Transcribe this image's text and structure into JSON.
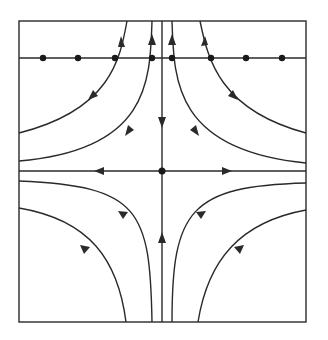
{
  "diagram": {
    "title": "",
    "type": "phase-portrait-saddle",
    "colors": {
      "stroke": "#2a2a2a",
      "background": "#ffffff"
    },
    "frame": {
      "x": 19,
      "y": 21,
      "width": 287,
      "height": 301
    },
    "top_line": {
      "y": 58,
      "dots_x": [
        43,
        78,
        115,
        152,
        172,
        211,
        246,
        282
      ]
    },
    "center": {
      "x": 162,
      "y": 171
    },
    "axes": {
      "horizontal": {
        "y": 171,
        "arrows": [
          "left",
          "right"
        ],
        "direction": "outward"
      },
      "vertical": {
        "x": 162,
        "arrows": [
          "down-from-top",
          "up-from-bottom"
        ],
        "direction": "inward"
      }
    },
    "trajectories": [
      {
        "name": "upper-left-outer",
        "arrows": [
          "up",
          "down-left"
        ]
      },
      {
        "name": "upper-left-inner",
        "arrows": [
          "up",
          "down-left"
        ]
      },
      {
        "name": "upper-right-inner",
        "arrows": [
          "up",
          "down-right"
        ]
      },
      {
        "name": "upper-right-outer",
        "arrows": [
          "up",
          "down-right"
        ]
      },
      {
        "name": "lower-left-inner",
        "arrows": [
          "up"
        ]
      },
      {
        "name": "lower-left-outer",
        "arrows": [
          "up"
        ]
      },
      {
        "name": "lower-right-inner",
        "arrows": [
          "up"
        ]
      },
      {
        "name": "lower-right-outer",
        "arrows": [
          "up"
        ]
      }
    ]
  }
}
